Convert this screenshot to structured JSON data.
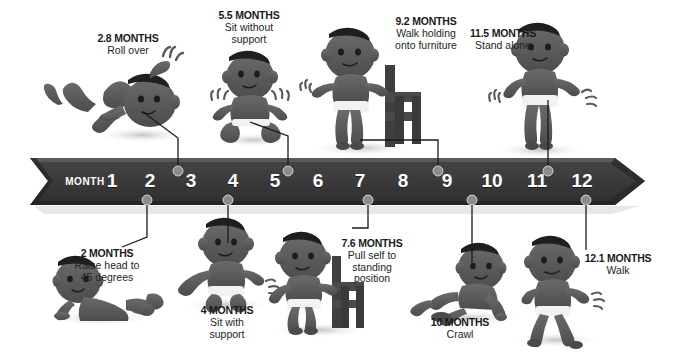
{
  "infographic": {
    "title": "Infant Motor Development Milestones Timeline",
    "axis_label": "MONTH",
    "month_ticks": [
      "1",
      "2",
      "3",
      "4",
      "5",
      "6",
      "7",
      "8",
      "9",
      "10",
      "11",
      "12"
    ],
    "colors": {
      "banner": "#3a3a3a",
      "banner_shadow": "#2a2a2a",
      "text_dark": "#231f20",
      "text_light": "#ffffff",
      "dot": "#8c8c8c",
      "figure": "#5a5a5a",
      "background": "#ffffff"
    }
  },
  "milestones_above": [
    {
      "months": "2.8 MONTHS",
      "description_line1": "Roll over",
      "description_line2": "",
      "value": 2.8
    },
    {
      "months": "5.5 MONTHS",
      "description_line1": "Sit without",
      "description_line2": "support",
      "value": 5.5
    },
    {
      "months": "9.2 MONTHS",
      "description_line1": "Walk holding",
      "description_line2": "onto furniture",
      "value": 9.2
    },
    {
      "months": "11.5 MONTHS",
      "description_line1": "Stand alone",
      "description_line2": "",
      "value": 11.5
    }
  ],
  "milestones_below": [
    {
      "months": "2 MONTHS",
      "description_line1": "Raise head to",
      "description_line2": "45 degrees",
      "description_line3": "",
      "value": 2
    },
    {
      "months": "4 MONTHS",
      "description_line1": "Sit with",
      "description_line2": "support",
      "description_line3": "",
      "value": 4
    },
    {
      "months": "7.6 MONTHS",
      "description_line1": "Pull self to",
      "description_line2": "standing",
      "description_line3": "position",
      "value": 7.6
    },
    {
      "months": "10 MONTHS",
      "description_line1": "Crawl",
      "description_line2": "",
      "description_line3": "",
      "value": 10
    },
    {
      "months": "12.1 MONTHS",
      "description_line1": "Walk",
      "description_line2": "",
      "description_line3": "",
      "value": 12.1
    }
  ]
}
